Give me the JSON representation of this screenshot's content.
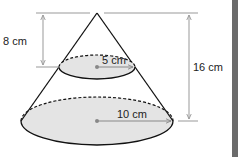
{
  "diagram": {
    "labels": {
      "top_height": "8 cm",
      "total_height": "16 cm",
      "small_radius": "5 cm",
      "large_radius": "10 cm"
    },
    "colors": {
      "outline": "#111111",
      "fill": "#e4e4e4",
      "dimension_line": "#999999",
      "side_bar": "#6b6b6b"
    }
  }
}
